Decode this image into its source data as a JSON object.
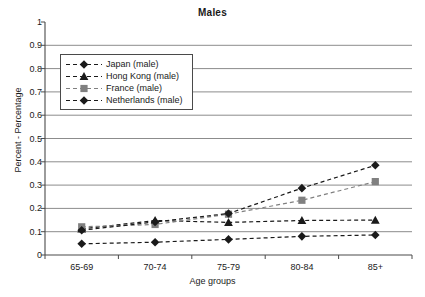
{
  "chart_data": {
    "type": "line",
    "title": "Males",
    "xlabel": "Age groups",
    "ylabel": "Percent - Percentage",
    "categories": [
      "65-69",
      "70-74",
      "75-79",
      "80-84",
      "85+"
    ],
    "ylim": [
      0,
      1
    ],
    "ytick_labels": [
      "0",
      "0.1",
      "0.2",
      "0.3",
      "0.4",
      "0.5",
      "0.6",
      "0.7",
      "0.8",
      "0.9",
      "1"
    ],
    "ytick_values": [
      0,
      0.1,
      0.2,
      0.3,
      0.4,
      0.5,
      0.6,
      0.7,
      0.8,
      0.9,
      1
    ],
    "grid": true,
    "legend_position": "upper-left",
    "series": [
      {
        "name": "Japan (male)",
        "marker": "diamond",
        "color": "#1a1a1a",
        "line_style": "dashed",
        "values": [
          0.048,
          0.055,
          0.067,
          0.08,
          0.086
        ]
      },
      {
        "name": "Hong Kong (male)",
        "marker": "triangle",
        "color": "#1a1a1a",
        "line_style": "dashed",
        "values": [
          0.112,
          0.148,
          0.14,
          0.148,
          0.15
        ]
      },
      {
        "name": "France (male)",
        "marker": "square",
        "color": "#808080",
        "line_style": "dashed",
        "values": [
          0.121,
          0.131,
          0.175,
          0.235,
          0.315
        ]
      },
      {
        "name": "Netherlands (male)",
        "marker": "diamond",
        "color": "#1a1a1a",
        "line_style": "dashed",
        "values": [
          0.106,
          0.142,
          0.178,
          0.287,
          0.385
        ]
      }
    ]
  },
  "axis_colors": {
    "gridline": "#8c8c8c",
    "axis": "#4a4a4a"
  }
}
